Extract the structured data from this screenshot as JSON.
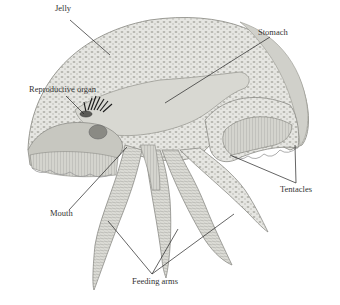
{
  "diagram": {
    "labels": [
      {
        "id": "jelly",
        "text": "Jelly",
        "x": 55,
        "y": 11,
        "line": [
          70,
          20,
          110,
          55
        ]
      },
      {
        "id": "stomach",
        "text": "Stomach",
        "x": 259,
        "y": 27,
        "line": [
          270,
          37,
          165,
          103
        ]
      },
      {
        "id": "reproductive-organ",
        "text": "Reproductive organ",
        "x": 29,
        "y": 87,
        "line": [
          66,
          96,
          84,
          114
        ]
      },
      {
        "id": "mouth",
        "text": "Mouth",
        "x": 50,
        "y": 210,
        "line": [
          69,
          210,
          127,
          147
        ]
      },
      {
        "id": "tentacles",
        "text": "Tentacles",
        "x": 280,
        "y": 184,
        "line_a": [
          296,
          183,
          230,
          155
        ],
        "line_b": [
          296,
          183,
          295,
          145
        ]
      },
      {
        "id": "feeding-arms",
        "text": "Feeding arms",
        "x": 132,
        "y": 275,
        "line_a": [
          152,
          274,
          108,
          221
        ],
        "line_b": [
          152,
          274,
          178,
          229
        ],
        "line_c": [
          152,
          274,
          234,
          214
        ]
      }
    ],
    "colors": {
      "background": "#ffffff",
      "bell_fill": "#e4e4e0",
      "bell_texture": "#b8b8b2",
      "stomach_fill": "#d8d8d2",
      "arm_fill": "#d6d6d0",
      "dark_fringe": "#222222",
      "line": "#222222"
    }
  }
}
